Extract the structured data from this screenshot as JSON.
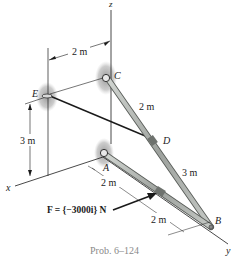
{
  "diagram": {
    "axes": {
      "x": "x",
      "y": "y",
      "z": "z"
    },
    "points": {
      "A": "A",
      "B": "B",
      "C": "C",
      "D": "D",
      "E": "E"
    },
    "dimensions": {
      "top_width": "2 m",
      "height_E": "3 m",
      "CD": "2 m",
      "DB": "3 m",
      "A_mid": "2 m",
      "mid_B": "2 m"
    },
    "force_label": "F = {−3000i} N",
    "caption": "Prob. 6–124",
    "colors": {
      "member": "#a8aca8",
      "member_edge": "#5a5e5a",
      "support_shadow": "#9a9a9a",
      "line": "#1a1a1a",
      "caption": "#8a8a8a"
    }
  }
}
